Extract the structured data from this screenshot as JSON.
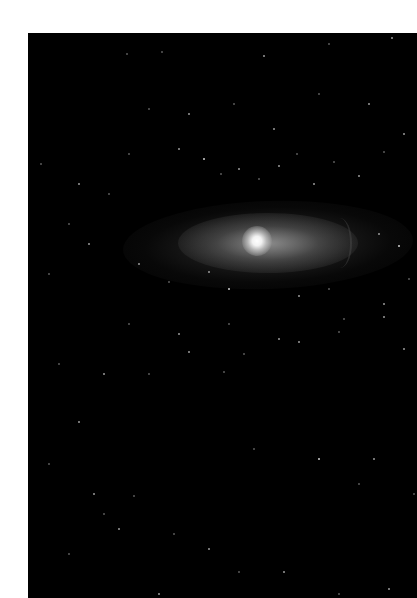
{
  "image": {
    "subject": "spiral galaxy with bright core against dark star field",
    "background_color": "#000000",
    "margin_color": "#ffffff",
    "core_color": "#ffffff",
    "halo_color": "#8a8a8a"
  },
  "stars": [
    [
      98,
      20,
      "d"
    ],
    [
      133,
      18,
      "d"
    ],
    [
      235,
      22,
      ""
    ],
    [
      300,
      10,
      "d"
    ],
    [
      363,
      4,
      ""
    ],
    [
      12,
      130,
      "d"
    ],
    [
      50,
      150,
      ""
    ],
    [
      100,
      120,
      "d"
    ],
    [
      150,
      115,
      ""
    ],
    [
      175,
      125,
      "b"
    ],
    [
      192,
      140,
      "d"
    ],
    [
      210,
      135,
      ""
    ],
    [
      230,
      145,
      "d"
    ],
    [
      250,
      132,
      ""
    ],
    [
      268,
      120,
      "d"
    ],
    [
      285,
      150,
      ""
    ],
    [
      305,
      128,
      "d"
    ],
    [
      330,
      142,
      ""
    ],
    [
      355,
      118,
      "d"
    ],
    [
      375,
      100,
      ""
    ],
    [
      120,
      75,
      "d"
    ],
    [
      160,
      80,
      ""
    ],
    [
      205,
      70,
      "d"
    ],
    [
      245,
      95,
      ""
    ],
    [
      290,
      60,
      "d"
    ],
    [
      340,
      70,
      ""
    ],
    [
      80,
      160,
      "d"
    ],
    [
      40,
      190,
      "d"
    ],
    [
      60,
      210,
      ""
    ],
    [
      20,
      240,
      "d"
    ],
    [
      110,
      230,
      ""
    ],
    [
      140,
      248,
      "d"
    ],
    [
      180,
      238,
      ""
    ],
    [
      200,
      255,
      "b"
    ],
    [
      270,
      262,
      ""
    ],
    [
      300,
      255,
      "d"
    ],
    [
      350,
      200,
      ""
    ],
    [
      370,
      212,
      "b"
    ],
    [
      380,
      245,
      "d"
    ],
    [
      355,
      270,
      ""
    ],
    [
      100,
      290,
      "d"
    ],
    [
      150,
      300,
      ""
    ],
    [
      200,
      290,
      "d"
    ],
    [
      250,
      305,
      ""
    ],
    [
      310,
      298,
      "d"
    ],
    [
      355,
      283,
      ""
    ],
    [
      30,
      330,
      "d"
    ],
    [
      75,
      340,
      ""
    ],
    [
      120,
      340,
      "d"
    ],
    [
      160,
      318,
      ""
    ],
    [
      215,
      320,
      "d"
    ],
    [
      270,
      308,
      ""
    ],
    [
      315,
      285,
      "d"
    ],
    [
      345,
      425,
      ""
    ],
    [
      290,
      425,
      "b"
    ],
    [
      195,
      338,
      "d"
    ],
    [
      50,
      388,
      ""
    ],
    [
      20,
      430,
      "d"
    ],
    [
      65,
      460,
      ""
    ],
    [
      75,
      480,
      "d"
    ],
    [
      90,
      495,
      ""
    ],
    [
      105,
      462,
      "d"
    ],
    [
      145,
      500,
      "d"
    ],
    [
      180,
      515,
      ""
    ],
    [
      210,
      538,
      "d"
    ],
    [
      255,
      538,
      ""
    ],
    [
      310,
      560,
      "d"
    ],
    [
      360,
      555,
      ""
    ],
    [
      40,
      520,
      "d"
    ],
    [
      130,
      560,
      ""
    ],
    [
      225,
      415,
      "d"
    ],
    [
      330,
      450,
      "d"
    ],
    [
      375,
      315,
      ""
    ],
    [
      385,
      460,
      "d"
    ]
  ]
}
